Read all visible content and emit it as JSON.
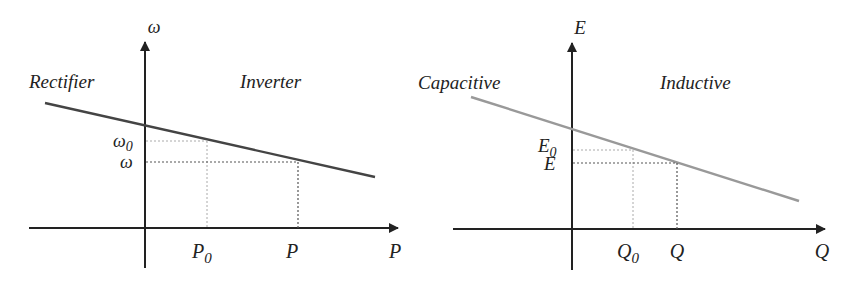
{
  "left_diagram": {
    "title": "Frequency droop (P-omega)",
    "y_axis_label": "ω",
    "x_axis_label": "P",
    "region_left": "Rectifier",
    "region_right": "Inverter",
    "y_tick_0": "ω",
    "y_tick_0_sub": "0",
    "y_tick_1": "ω",
    "x_tick_0": "P",
    "x_tick_0_sub": "0",
    "x_tick_1": "P",
    "line_color": "#444444"
  },
  "right_diagram": {
    "title": "Voltage droop (Q-E)",
    "y_axis_label": "E",
    "x_axis_label": "Q",
    "region_left": "Capacitive",
    "region_right": "Inductive",
    "y_tick_0": "E",
    "y_tick_0_sub": "0",
    "y_tick_1": "E",
    "x_tick_0": "Q",
    "x_tick_0_sub": "0",
    "x_tick_1": "Q",
    "line_color": "#999999"
  }
}
